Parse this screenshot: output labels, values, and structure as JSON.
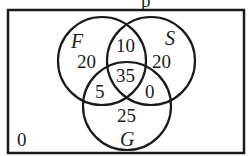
{
  "title_fragment": "p",
  "universe": {
    "outside_value": "0"
  },
  "sets": [
    {
      "id": "F",
      "label": "F",
      "cx": 102,
      "cy": 61,
      "r": 44
    },
    {
      "id": "S",
      "label": "S",
      "cx": 151,
      "cy": 61,
      "r": 44
    },
    {
      "id": "G",
      "label": "G",
      "cx": 127,
      "cy": 106,
      "r": 44
    }
  ],
  "regions": {
    "F_only": "20",
    "S_only": "20",
    "G_only": "25",
    "F_and_S_only": "10",
    "F_and_G_only": "5",
    "S_and_G_only": "0",
    "F_S_G": "35"
  },
  "colors": {
    "stroke": "#1a1a1a",
    "background": "#ffffff"
  }
}
